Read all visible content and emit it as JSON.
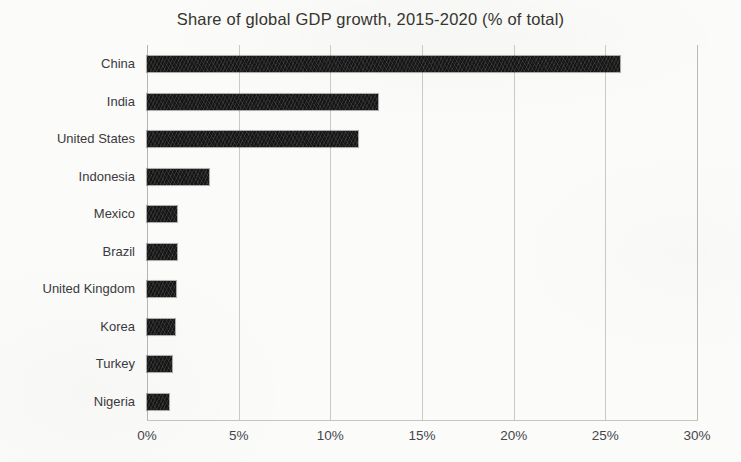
{
  "chart_data": {
    "type": "bar",
    "orientation": "horizontal",
    "title": "Share of global GDP growth, 2015-2020 (% of total)",
    "xlabel": "",
    "ylabel": "",
    "xlim": [
      0,
      30
    ],
    "xtick_labels": [
      "0%",
      "5%",
      "10%",
      "15%",
      "20%",
      "25%",
      "30%"
    ],
    "xtick_values": [
      0,
      5,
      10,
      15,
      20,
      25,
      30
    ],
    "grid": "vertical",
    "legend": "none",
    "value_suffix": "%",
    "categories": [
      "China",
      "India",
      "United States",
      "Indonesia",
      "Mexico",
      "Brazil",
      "United Kingdom",
      "Korea",
      "Turkey",
      "Nigeria"
    ],
    "values": [
      25.8,
      12.6,
      11.5,
      3.4,
      1.65,
      1.65,
      1.6,
      1.5,
      1.35,
      1.2
    ],
    "bar_color": "#161616",
    "grid_color": "#c9c9c6",
    "text_color": "#38383a",
    "background_color": "#fbfbfa"
  }
}
